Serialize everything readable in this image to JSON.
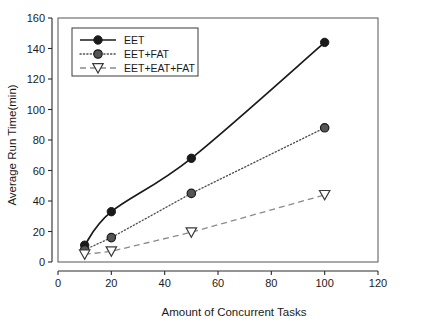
{
  "chart_data": {
    "type": "line",
    "title": "",
    "xlabel": "Amount of Concurrent Tasks",
    "ylabel": "Average Run Time(min)",
    "xlim": [
      0,
      120
    ],
    "ylim": [
      0,
      160
    ],
    "xticks": [
      0,
      20,
      40,
      60,
      80,
      100,
      120
    ],
    "yticks": [
      0,
      20,
      40,
      60,
      80,
      100,
      120,
      140,
      160
    ],
    "xtick_labels": [
      "0",
      "20",
      "40",
      "60",
      "80",
      "100",
      "120"
    ],
    "ytick_labels": [
      "0",
      "20",
      "40",
      "60",
      "80",
      "100",
      "120",
      "140",
      "160"
    ],
    "grid": false,
    "legend_position": "upper-left-inside",
    "x": [
      10,
      20,
      50,
      100
    ],
    "series": [
      {
        "name": "EET",
        "values": [
          11,
          33,
          68,
          144
        ],
        "line_style": "solid",
        "marker": "filled-circle",
        "color": "#1a1a1a"
      },
      {
        "name": "EET+FAT",
        "values": [
          8,
          16,
          45,
          88
        ],
        "line_style": "dotted",
        "marker": "gray-circle",
        "color": "#555555"
      },
      {
        "name": "EET+EAT+FAT",
        "values": [
          5,
          7,
          19.5,
          44
        ],
        "line_style": "dashed",
        "marker": "hollow-triangle",
        "color": "#8a8a8a"
      }
    ]
  },
  "legend": {
    "entries": [
      {
        "label": "EET"
      },
      {
        "label": "EET+FAT"
      },
      {
        "label": "EET+EAT+FAT"
      }
    ]
  },
  "axes": {
    "x_title": "Amount of Concurrent Tasks",
    "y_title": "Average Run Time(min)"
  }
}
